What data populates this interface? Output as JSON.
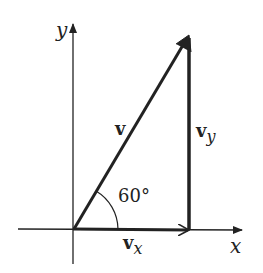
{
  "diagram": {
    "axis_x_label": "x",
    "axis_y_label": "y",
    "vector_label": "v",
    "vx_main": "v",
    "vx_sub": "x",
    "vy_main": "v",
    "vy_sub": "y",
    "angle_label": "60°",
    "colors": {
      "stroke": "#222222",
      "background": "#ffffff"
    }
  }
}
